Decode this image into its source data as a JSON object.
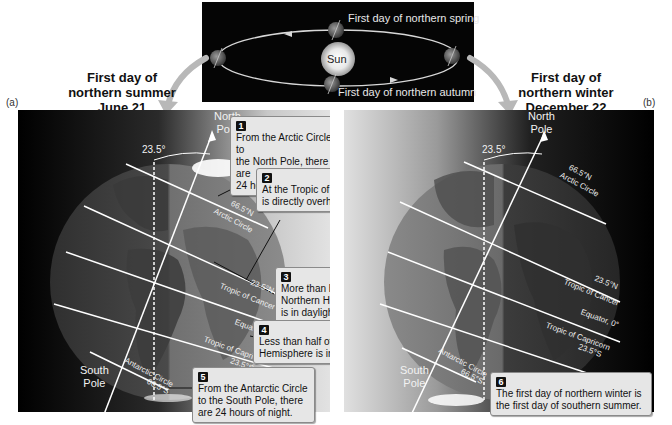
{
  "orbit": {
    "spring_label": "First day of northern spring",
    "autumn_label": "First day of northern autumn",
    "sun_label": "Sun"
  },
  "panel_a": {
    "tag": "(a)",
    "heading_line1": "First day of",
    "heading_line2": "northern summer",
    "heading_line3": "June 21",
    "tilt_label": "23.5°",
    "north_pole_line1": "North",
    "north_pole_line2": "Pole",
    "south_pole_line1": "South",
    "south_pole_line2": "Pole",
    "latitudes": {
      "arctic_deg": "66.5°N",
      "arctic_name": "Arctic Circle",
      "cancer_deg": "23.5°N",
      "cancer_name": "Tropic of Cancer",
      "equator": "Equator, 0°",
      "capricorn_name": "Tropic of Capricorn",
      "capricorn_deg": "23.5°S",
      "antarctic_name": "Antarctic Circle",
      "antarctic_deg": "66.5°S"
    },
    "callouts": [
      {
        "num": "1",
        "line1": "From the Arctic Circle to",
        "line2": "the North Pole, there are",
        "line3": "24 hours of daylight."
      },
      {
        "num": "2",
        "line1": "At the Tropic of Cancer, the Sun",
        "line2": "is directly overhead at noon."
      },
      {
        "num": "3",
        "line1": "More than half of the",
        "line2": "Northern Hemisphere",
        "line3": "is in daylight."
      },
      {
        "num": "4",
        "line1": "Less than half of the Southern",
        "line2": "Hemisphere is in daylight."
      },
      {
        "num": "5",
        "line1": "From the Antarctic Circle",
        "line2": "to the South Pole, there",
        "line3": "are 24 hours of night."
      }
    ]
  },
  "panel_b": {
    "tag": "(b)",
    "heading_line1": "First day of",
    "heading_line2": "northern winter",
    "heading_line3": "December 22",
    "tilt_label": "23.5°",
    "north_pole_line1": "North",
    "north_pole_line2": "Pole",
    "south_pole_line1": "South",
    "south_pole_line2": "Pole",
    "latitudes": {
      "arctic_deg": "66.5°N",
      "arctic_name": "Arctic Circle",
      "cancer_deg": "23.5°N",
      "cancer_name": "Tropic of Cancer",
      "equator": "Equator, 0°",
      "capricorn_name": "Tropic of Capricorn",
      "capricorn_deg": "23.5°S",
      "antarctic_name": "Antarctic Circle",
      "antarctic_deg": "66.5°S"
    },
    "callouts": [
      {
        "num": "6",
        "line1": "The first day of northern winter is",
        "line2": "the first day of southern summer."
      }
    ]
  },
  "colors": {
    "panel_dark": "#050505",
    "callout_bg": "#e6e6e6",
    "callout_border": "#8a8a8a",
    "arrow_gray": "#b0b0b0"
  }
}
